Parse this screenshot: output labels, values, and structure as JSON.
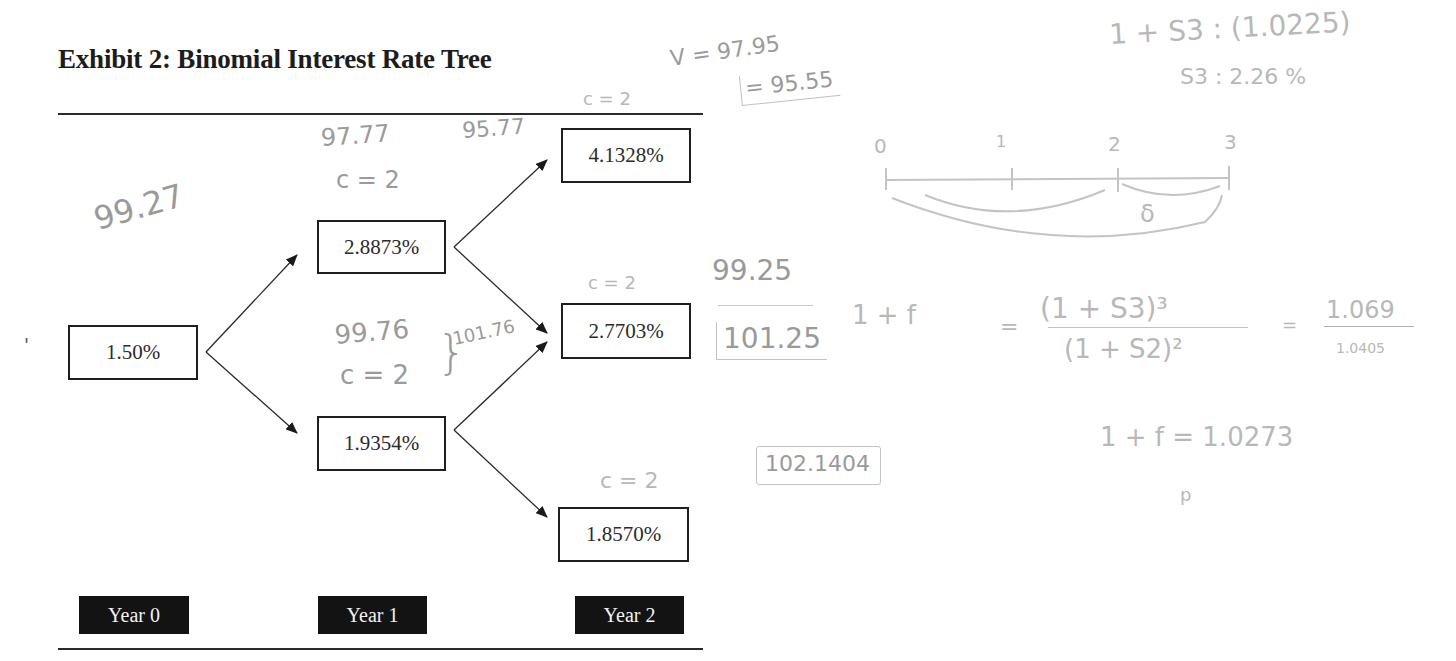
{
  "exhibit": {
    "title": "Exhibit 2: Binomial Interest Rate Tree"
  },
  "tree": {
    "nodes": [
      {
        "id": "y0",
        "label": "1.50%",
        "year": 0
      },
      {
        "id": "y1_up",
        "label": "2.8873%",
        "year": 1
      },
      {
        "id": "y1_down",
        "label": "1.9354%",
        "year": 1
      },
      {
        "id": "y2_uu",
        "label": "4.1328%",
        "year": 2
      },
      {
        "id": "y2_ud",
        "label": "2.7703%",
        "year": 2
      },
      {
        "id": "y2_dd",
        "label": "1.8570%",
        "year": 2
      }
    ],
    "years": [
      "Year 0",
      "Year 1",
      "Year 2"
    ],
    "edges": [
      {
        "from": "y0",
        "to": "y1_up"
      },
      {
        "from": "y0",
        "to": "y1_down"
      },
      {
        "from": "y1_up",
        "to": "y2_uu"
      },
      {
        "from": "y1_up",
        "to": "y2_ud"
      },
      {
        "from": "y1_down",
        "to": "y2_ud"
      },
      {
        "from": "y1_down",
        "to": "y2_dd"
      }
    ]
  },
  "annotations": {
    "left_value": "99.27",
    "up_node_values": "97.77",
    "up_node_values_2": "95.77",
    "up_node_coupon": "c = 2",
    "down_node_value": "99.76",
    "down_node_coupon": "c = 2",
    "down_node_brace_total": "101.76",
    "top_coupon": "c = 2",
    "top_v": "V = 97.95",
    "top_v_boxed": "= 95.55",
    "mid_coupon": "c = 2",
    "bottom_coupon": "c = 2",
    "mid_value_top": "99.25",
    "mid_value_boxed": "101.25",
    "bottom_boxed": "102.1404",
    "spot_eq": "1 + S3 : (1.0225)",
    "spot_result": "S3 : 2.26 %",
    "timeline_labels": [
      "0",
      "1",
      "2",
      "3"
    ],
    "timeline_delta": "δ",
    "forward_lhs": "1 + f",
    "forward_num": "(1 + S3)³",
    "forward_den": "(1 + S2)²",
    "forward_ratio_num": "1.069",
    "forward_ratio_den": "1.0405",
    "forward_result": "1 + f = 1.0273",
    "stray_mark": "p"
  }
}
